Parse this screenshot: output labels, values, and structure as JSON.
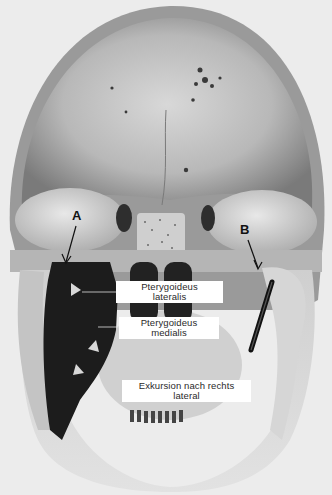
{
  "figure": {
    "colors": {
      "background": "#ececec",
      "bone_light": "#d9d9d9",
      "bone_mid": "#a8a8a8",
      "bone_dark": "#6e6e6e",
      "muscle": "#1c1c1c",
      "label_bg": "#ffffff",
      "label_text": "#2a2a2a"
    }
  },
  "markers": {
    "a": "A",
    "b": "B"
  },
  "labels": [
    {
      "line1": "Pterygoideus",
      "line2": "lateralis"
    },
    {
      "line1": "Pterygoideus",
      "line2": "medialis"
    },
    {
      "line1": "Exkursion nach rechts",
      "line2": "lateral"
    }
  ]
}
